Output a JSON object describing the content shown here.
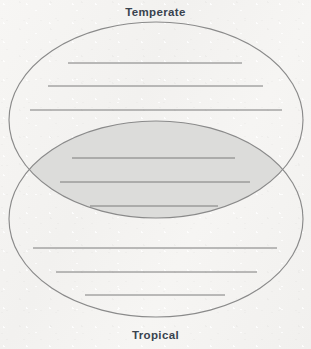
{
  "worksheet": {
    "type": "venn-diagram",
    "title_top": "Temperate",
    "title_bottom": "Tropical",
    "label_color": "#39434f",
    "background_color": "#f4f3f1",
    "ellipse_stroke_color": "#8a8a8a",
    "ellipse_fill": "none",
    "overlap_fill_color": "#dcdcda",
    "writing_line_color": "#6f6f6f",
    "canvas": {
      "width": 311,
      "height": 349
    },
    "ellipses": [
      {
        "name": "temperate-ellipse",
        "cx": 156,
        "cy": 120,
        "rx": 147,
        "ry": 98
      },
      {
        "name": "tropical-ellipse",
        "cx": 156,
        "cy": 219,
        "rx": 147,
        "ry": 98
      }
    ],
    "intersection_points": [
      {
        "x": 22,
        "y": 170
      },
      {
        "x": 288,
        "y": 170
      }
    ],
    "zones": [
      {
        "name": "temperate-only",
        "label": "Temperate",
        "lines": [
          {
            "x1": 68,
            "x2": 242,
            "y": 63
          },
          {
            "x1": 48,
            "x2": 263,
            "y": 86
          },
          {
            "x1": 30,
            "x2": 282,
            "y": 110
          }
        ]
      },
      {
        "name": "overlap-both",
        "label": "Both",
        "lines": [
          {
            "x1": 72,
            "x2": 235,
            "y": 158
          },
          {
            "x1": 60,
            "x2": 250,
            "y": 182
          },
          {
            "x1": 90,
            "x2": 218,
            "y": 206
          }
        ]
      },
      {
        "name": "tropical-only",
        "label": "Tropical",
        "lines": [
          {
            "x1": 33,
            "x2": 277,
            "y": 248
          },
          {
            "x1": 56,
            "x2": 257,
            "y": 272
          },
          {
            "x1": 85,
            "x2": 225,
            "y": 295
          }
        ]
      }
    ]
  }
}
